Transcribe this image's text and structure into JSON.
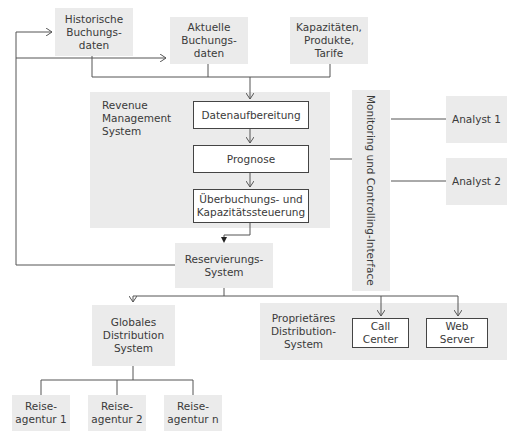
{
  "inputs": {
    "historical": "Historische\nBuchungs-\ndaten",
    "current": "Aktuelle\nBuchungs-\ndaten",
    "capacities": "Kapazitäten,\nProdukte,\nTarife"
  },
  "rms": {
    "label": "Revenue\nManagement\nSystem",
    "steps": [
      "Datenaufbereitung",
      "Prognose",
      "Überbuchungs- und\nKapazitätssteuerung"
    ]
  },
  "monitoring": {
    "label": "Monitoring und Controlling-Interface"
  },
  "analysts": [
    "Analyst 1",
    "Analyst 2"
  ],
  "reservation": {
    "label": "Reservierungs-\nSystem"
  },
  "gds": {
    "label": "Globales\nDistribution\nSystem"
  },
  "proprietary": {
    "label": "Proprietäres\nDistribution-\nSystem",
    "channels": [
      "Call\nCenter",
      "Web\nServer"
    ]
  },
  "agencies": [
    "Reise-\nagentur 1",
    "Reise-\nagentur 2",
    "Reise-\nagentur n"
  ],
  "colors": {
    "box_fill": "#ebebeb",
    "line": "#555555"
  }
}
